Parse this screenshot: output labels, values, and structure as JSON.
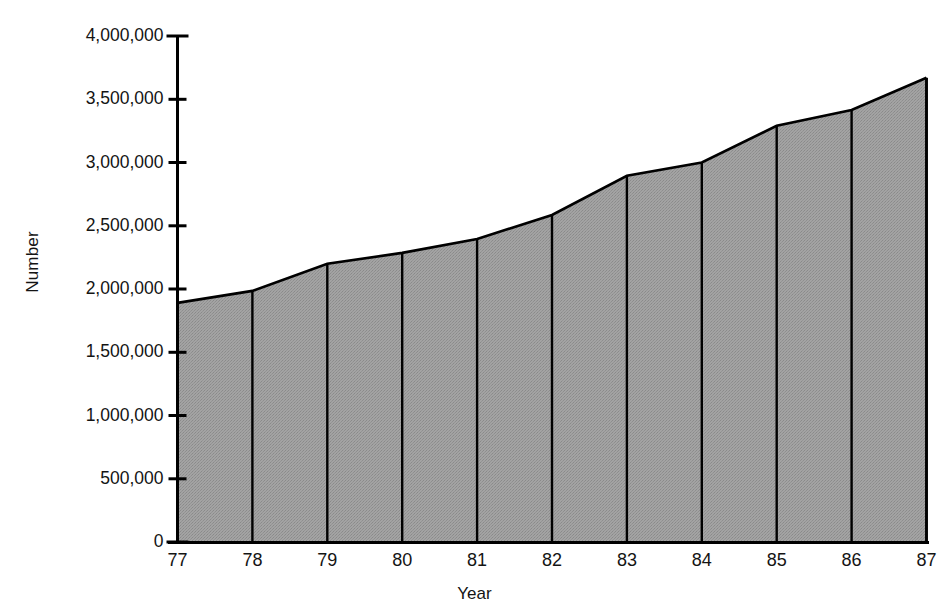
{
  "chart_data": {
    "type": "area",
    "title": "",
    "xlabel": "Year",
    "ylabel": "Number",
    "categories": [
      "77",
      "78",
      "79",
      "80",
      "81",
      "82",
      "83",
      "84",
      "85",
      "86",
      "87"
    ],
    "values": [
      1890000,
      1985000,
      2200000,
      2285000,
      2395000,
      2585000,
      2895000,
      3000000,
      3290000,
      3415000,
      3670000
    ],
    "series": [
      {
        "name": "Number",
        "values": [
          1890000,
          1985000,
          2200000,
          2285000,
          2395000,
          2585000,
          2895000,
          3000000,
          3290000,
          3415000,
          3670000
        ]
      }
    ],
    "ylim": [
      0,
      4000000
    ],
    "xlim": [
      "77",
      "87"
    ],
    "ytick_labels": [
      "0",
      "500,000",
      "1,000,000",
      "1,500,000",
      "2,000,000",
      "2,500,000",
      "3,000,000",
      "3,500,000",
      "4,000,000"
    ],
    "ytick_values": [
      0,
      500000,
      1000000,
      1500000,
      2000000,
      2500000,
      3000000,
      3500000,
      4000000
    ],
    "xtick_labels": [
      "77",
      "78",
      "79",
      "80",
      "81",
      "82",
      "83",
      "84",
      "85",
      "86",
      "87"
    ],
    "grid": false,
    "legend": false,
    "legend_position": "none",
    "fill_color": "#9b9b9b",
    "line_color": "#000000",
    "axis_color": "#000000",
    "background_color": "#ffffff"
  },
  "axes": {
    "y_title": "Number",
    "x_title": "Year"
  }
}
